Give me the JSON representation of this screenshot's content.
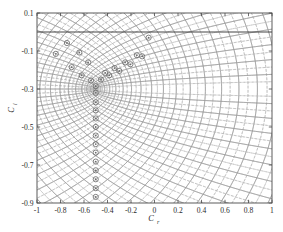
{
  "figure": {
    "background_color": "#ffffff",
    "axes_color": "#4a4a4a",
    "contour_solid_color": "#9a9a9a",
    "contour_dashed_color": "#b5b5b5",
    "zero_line_color": "#3a3a3a",
    "marker_color": "#6d6d6d"
  },
  "chart_data": {
    "type": "line",
    "title": "",
    "subtitle": "",
    "xlabel": "C",
    "xlabel_sub": "r",
    "ylabel": "C",
    "ylabel_sub": "i",
    "xlim": [
      -1,
      1
    ],
    "ylim": [
      -0.9,
      0.1
    ],
    "grid": false,
    "legend": null,
    "xticks": [
      -1,
      -0.8,
      -0.6,
      -0.4,
      -0.2,
      0,
      0.2,
      0.4,
      0.6,
      0.8,
      1
    ],
    "xticklabels": [
      "-1",
      "-0.8",
      "-0.6",
      "-0.4",
      "-0.2",
      "0",
      "0.2",
      "0.4",
      "0.6",
      "0.8",
      "1"
    ],
    "yticks": [
      0.1,
      -0.1,
      -0.3,
      -0.5,
      -0.7,
      -0.9
    ],
    "yticklabels": [
      "0.1",
      "-0.1",
      "-0.3",
      "-0.5",
      "-0.7",
      "-0.9"
    ],
    "annotations": [
      {
        "label": "zero-reference-line",
        "type": "hline",
        "y": 0.0
      }
    ],
    "series": [
      {
        "name": "contour-real-part",
        "style": "solid",
        "color": "#9a9a9a",
        "description": "Family of solid contour curves of the real part; hyperbola-like arcs opening rightward, converging toward the singular point near (-0.5, -0.3) and becoming near-vertical above the zero line."
      },
      {
        "name": "contour-imag-part",
        "style": "dashed",
        "color": "#b5b5b5",
        "description": "Family of dashed contour curves of the imaginary part, interleaved between the solid contours."
      }
    ],
    "markers": {
      "name": "root-markers",
      "shape": "circle",
      "color": "#6d6d6d",
      "size": 2.6,
      "points": [
        [
          -0.84,
          -0.115
        ],
        [
          -0.745,
          -0.058
        ],
        [
          -0.705,
          -0.185
        ],
        [
          -0.64,
          -0.108
        ],
        [
          -0.62,
          -0.228
        ],
        [
          -0.565,
          -0.16
        ],
        [
          -0.54,
          -0.255
        ],
        [
          -0.5,
          -0.285
        ],
        [
          -0.455,
          -0.25
        ],
        [
          -0.42,
          -0.215
        ],
        [
          -0.385,
          -0.228
        ],
        [
          -0.34,
          -0.19
        ],
        [
          -0.3,
          -0.205
        ],
        [
          -0.25,
          -0.16
        ],
        [
          -0.205,
          -0.17
        ],
        [
          -0.15,
          -0.122
        ],
        [
          -0.105,
          -0.128
        ],
        [
          -0.05,
          -0.03
        ],
        [
          -0.5,
          -0.32
        ],
        [
          -0.5,
          -0.37
        ],
        [
          -0.5,
          -0.412
        ],
        [
          -0.5,
          -0.455
        ],
        [
          -0.5,
          -0.5
        ],
        [
          -0.5,
          -0.545
        ],
        [
          -0.5,
          -0.59
        ],
        [
          -0.5,
          -0.635
        ],
        [
          -0.5,
          -0.682
        ],
        [
          -0.5,
          -0.728
        ],
        [
          -0.5,
          -0.775
        ],
        [
          -0.5,
          -0.822
        ],
        [
          -0.5,
          -0.868
        ]
      ]
    }
  }
}
